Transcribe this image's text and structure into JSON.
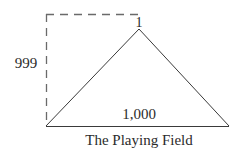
{
  "diagram": {
    "apex_label": "1",
    "height_label": "999",
    "base_label": "1,000",
    "caption": "The Playing Field",
    "colors": {
      "line": "#3a3a3a",
      "dashed": "#6a6a6a",
      "text": "#2b2b2b",
      "background": "#ffffff"
    }
  }
}
